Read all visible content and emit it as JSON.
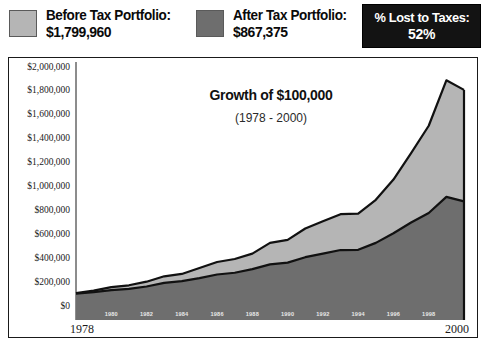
{
  "legend": {
    "before": {
      "label": "Before Tax Portfolio:",
      "value": "$1,799,960",
      "color": "#b5b5b5"
    },
    "after": {
      "label": "After Tax Portfolio:",
      "value": "$867,375",
      "color": "#6e6e6e"
    },
    "taxes": {
      "label": "% Lost to Taxes:",
      "value": "52%",
      "background": "#131313",
      "text_color": "#ffffff"
    }
  },
  "chart_data": {
    "type": "area",
    "title": "Growth of $100,000",
    "subtitle": "(1978 - 2000)",
    "xlabel": "",
    "ylabel": "",
    "ylim": [
      0,
      2000000
    ],
    "grid": false,
    "legend_position": "top",
    "y_tick_labels": [
      "$2,000,000",
      "$1,800,000",
      "$1,600,000",
      "$1,400,000",
      "$1,200,000",
      "$1,000,000",
      "$800,000",
      "$600,000",
      "$400,000",
      "$200,000",
      "$0"
    ],
    "y_tick_values": [
      2000000,
      1800000,
      1600000,
      1400000,
      1200000,
      1000000,
      800000,
      600000,
      400000,
      200000,
      0
    ],
    "x_axis_start_label": "1978",
    "x_axis_end_label": "2000",
    "x_inner_tick_labels": [
      "1980",
      "1982",
      "1984",
      "1986",
      "1988",
      "1990",
      "1992",
      "1994",
      "1996",
      "1998"
    ],
    "x": [
      1978,
      1979,
      1980,
      1981,
      1982,
      1983,
      1984,
      1985,
      1986,
      1987,
      1988,
      1989,
      1990,
      1991,
      1992,
      1993,
      1994,
      1995,
      1996,
      1997,
      1998,
      1999,
      2000
    ],
    "series": [
      {
        "name": "Before Tax Portfolio",
        "color": "#b5b5b5",
        "values": [
          100000,
          120000,
          150000,
          165000,
          195000,
          240000,
          260000,
          310000,
          360000,
          385000,
          430000,
          520000,
          545000,
          640000,
          700000,
          760000,
          765000,
          880000,
          1050000,
          1270000,
          1500000,
          1880000,
          1799960
        ]
      },
      {
        "name": "After Tax Portfolio",
        "color": "#6e6e6e",
        "values": [
          95000,
          108000,
          125000,
          135000,
          155000,
          185000,
          200000,
          225000,
          255000,
          270000,
          300000,
          340000,
          355000,
          400000,
          430000,
          460000,
          462000,
          520000,
          600000,
          690000,
          770000,
          905000,
          867375
        ]
      }
    ]
  }
}
